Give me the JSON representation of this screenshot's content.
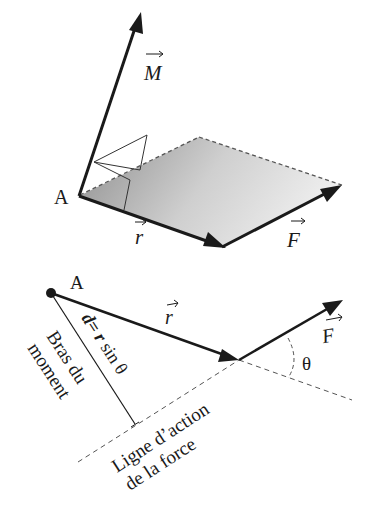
{
  "colors": {
    "ink": "#1a1a1a",
    "plane_dark": "#8a8a8a",
    "plane_light": "#e2e2e2",
    "dash": "#555555"
  },
  "top_diagram": {
    "point_label": "A",
    "moment_vector_label": "M",
    "position_vector_label": "r",
    "force_vector_label": "F"
  },
  "bottom_diagram": {
    "point_label": "A",
    "position_vector_label": "r",
    "force_vector_label": "F",
    "angle_label": "θ",
    "moment_arm_formula": {
      "d": "d",
      "eq": "=",
      "r": "r",
      "rest": " sin θ"
    },
    "moment_arm_caption": [
      "Bras du",
      "moment"
    ],
    "line_of_action_caption": [
      "Ligne d’action",
      "de la force"
    ]
  }
}
